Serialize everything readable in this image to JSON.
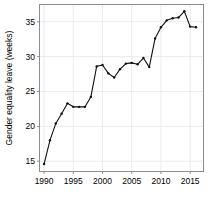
{
  "chart_data": {
    "type": "line",
    "title": "",
    "xlabel": "",
    "ylabel": "Gender equality leave (weeks)",
    "xlim": [
      1989.3,
      1990.0
    ],
    "ylim": [
      13.6,
      37.4
    ],
    "xlim_actual": [
      1989.3,
      2017.2
    ],
    "grid": true,
    "legend": "none",
    "marker": "filled-circle",
    "line_color": "#111111",
    "grid_color": "#e3e3ea",
    "frame_color": "#8c8c8c",
    "x": [
      1990,
      1991,
      1992,
      1993,
      1994,
      1995,
      1996,
      1997,
      1998,
      1999,
      2000,
      2001,
      2002,
      2003,
      2004,
      2005,
      2006,
      2007,
      2008,
      2009,
      2010,
      2011,
      2012,
      2013,
      2014,
      2015,
      2016
    ],
    "values": [
      14.6,
      18.0,
      20.4,
      21.8,
      23.3,
      22.8,
      22.8,
      22.8,
      24.2,
      28.6,
      28.8,
      27.6,
      27.0,
      28.2,
      29.0,
      29.1,
      28.9,
      29.8,
      28.5,
      32.6,
      34.2,
      35.2,
      35.5,
      35.6,
      36.5,
      34.3,
      34.2
    ],
    "xticks": [
      1990,
      1995,
      2000,
      2005,
      2010,
      2015
    ],
    "xtick_labels": [
      "1990",
      "1995",
      "2000",
      "2005",
      "2010",
      "2015"
    ],
    "yticks": [
      15,
      20,
      25,
      30,
      35
    ],
    "ytick_labels": [
      "15",
      "20",
      "25",
      "30",
      "35"
    ]
  }
}
